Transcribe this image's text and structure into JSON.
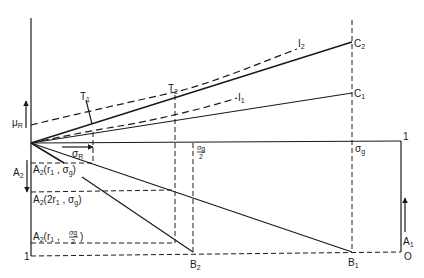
{
  "labels": {
    "mu_r": "μ",
    "mu_r_sub": "R",
    "sigma_r": "σ",
    "sigma_r_sub": "R",
    "sigma_g": "σ",
    "sigma_g_sub": "g",
    "sigma_g_half_num": "σ",
    "sigma_g_half_sub": "g",
    "sigma_g_half_den": "2",
    "t1": "T",
    "t1_sub": "1",
    "t2": "T",
    "t2_sub": "2",
    "i1": "I",
    "i1_sub": "1",
    "i2": "I",
    "i2_sub": "2",
    "c1": "C",
    "c1_sub": "1",
    "c2": "C",
    "c2_sub": "2",
    "b1": "B",
    "b1_sub": "1",
    "b2": "B",
    "b2_sub": "2",
    "a1": "A",
    "a1_sub": "1",
    "a2": "A",
    "a2_sub": "2",
    "origin": "O",
    "one_right": "1",
    "one_left": "1",
    "a2_r1_sg": {
      "A": "A",
      "sub": "2",
      "args": "(r",
      "r_sub": "1",
      "mid": " , σ",
      "s_sub": "g",
      "close": ")"
    },
    "a2_2r1_sg": {
      "A": "A",
      "sub": "2",
      "args": "(2r",
      "r_sub": "1",
      "mid": " , σ",
      "s_sub": "g",
      "close": ")"
    },
    "a2_r1_sg2": {
      "A": "A",
      "sub": "2",
      "args": "(r",
      "r_sub": "1",
      "mid": " , ",
      "frac_num": "σg",
      "frac_den": "2",
      "close": ")"
    }
  },
  "colors": {
    "ink": "#1a1a1a",
    "background": "#ffffff"
  }
}
